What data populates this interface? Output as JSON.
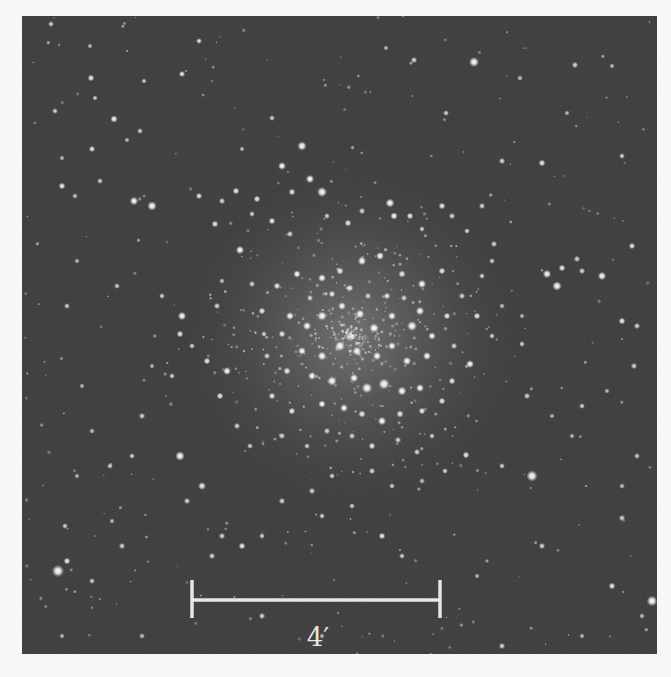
{
  "image": {
    "subject": "globular star cluster",
    "colors": {
      "page_background": "#f7f7f7",
      "sky_background": "#3b3b3b",
      "star": "#ffffff",
      "scale_bar": "#e6e6e6"
    }
  },
  "scale_bar": {
    "label": "4′",
    "x1": 170,
    "x2": 418,
    "y": 584,
    "tick_top": 564,
    "tick_bottom": 602,
    "label_x": 296,
    "label_y": 630
  },
  "cluster_core": {
    "cx": 330,
    "cy": 320,
    "r1": 70,
    "r2": 150,
    "r3": 230
  },
  "stars": [
    [
      177,
      25,
      2.2,
      0.9
    ],
    [
      160,
      58,
      2.4,
      0.9
    ],
    [
      122,
      65,
      2.0,
      0.8
    ],
    [
      73,
      82,
      2.0,
      0.8
    ],
    [
      92,
      103,
      2.8,
      0.95
    ],
    [
      118,
      115,
      2.2,
      0.8
    ],
    [
      70,
      133,
      2.4,
      0.9
    ],
    [
      40,
      170,
      2.6,
      0.9
    ],
    [
      250,
      102,
      2.2,
      0.8
    ],
    [
      280,
      130,
      3.5,
      1
    ],
    [
      260,
      150,
      3.0,
      1
    ],
    [
      288,
      163,
      3.2,
      1
    ],
    [
      300,
      176,
      3.8,
      1
    ],
    [
      270,
      176,
      2.6,
      0.9
    ],
    [
      235,
      183,
      2.6,
      0.9
    ],
    [
      214,
      175,
      2.6,
      0.9
    ],
    [
      177,
      180,
      2.4,
      0.9
    ],
    [
      193,
      208,
      2.6,
      0.9
    ],
    [
      230,
      198,
      2.2,
      0.8
    ],
    [
      29,
      8,
      2.2,
      0.8
    ],
    [
      68,
      30,
      2.0,
      0.7
    ],
    [
      69,
      62,
      2.6,
      0.9
    ],
    [
      392,
      44,
      2.4,
      0.8
    ],
    [
      424,
      97,
      2.2,
      0.8
    ],
    [
      452,
      46,
      3.8,
      1
    ],
    [
      498,
      62,
      2.2,
      0.7
    ],
    [
      553,
      49,
      2.4,
      0.8
    ],
    [
      545,
      97,
      2.0,
      0.7
    ],
    [
      33,
      95,
      2.2,
      0.8
    ],
    [
      40,
      142,
      2.0,
      0.7
    ],
    [
      105,
      124,
      2.0,
      0.7
    ],
    [
      78,
      165,
      2.2,
      0.8
    ],
    [
      53,
      180,
      2.2,
      0.7
    ],
    [
      112,
      185,
      3.2,
      1
    ],
    [
      130,
      190,
      3.6,
      1
    ],
    [
      200,
      185,
      2.4,
      0.8
    ],
    [
      364,
      32,
      2.0,
      0.7
    ],
    [
      480,
      145,
      2.4,
      0.8
    ],
    [
      520,
      147,
      2.6,
      0.9
    ],
    [
      472,
      228,
      2.4,
      0.8
    ],
    [
      220,
      133,
      2.0,
      0.7
    ],
    [
      590,
      50,
      2.0,
      0.7
    ],
    [
      600,
      140,
      2.2,
      0.8
    ],
    [
      610,
      230,
      2.4,
      0.9
    ],
    [
      535,
      270,
      3.6,
      1
    ],
    [
      525,
      258,
      3.2,
      1
    ],
    [
      540,
      252,
      2.6,
      0.9
    ],
    [
      560,
      255,
      2.4,
      0.8
    ],
    [
      555,
      243,
      2.4,
      0.8
    ],
    [
      580,
      260,
      3.2,
      1
    ],
    [
      600,
      305,
      2.6,
      0.9
    ],
    [
      615,
      310,
      2.4,
      0.8
    ],
    [
      612,
      350,
      2.4,
      0.8
    ],
    [
      585,
      375,
      2.0,
      0.7
    ],
    [
      560,
      390,
      2.2,
      0.8
    ],
    [
      530,
      400,
      2.0,
      0.7
    ],
    [
      505,
      380,
      2.4,
      0.8
    ],
    [
      500,
      328,
      2.2,
      0.8
    ],
    [
      615,
      440,
      2.2,
      0.8
    ],
    [
      600,
      470,
      2.2,
      0.7
    ],
    [
      550,
      420,
      2.0,
      0.7
    ],
    [
      510,
      460,
      4.2,
      1
    ],
    [
      480,
      450,
      2.2,
      0.8
    ],
    [
      444,
      439,
      2.6,
      0.9
    ],
    [
      423,
      455,
      2.2,
      0.8
    ],
    [
      600,
      502,
      2.4,
      0.8
    ],
    [
      630,
      585,
      4.0,
      1
    ],
    [
      590,
      570,
      2.6,
      0.9
    ],
    [
      520,
      530,
      2.4,
      0.8
    ],
    [
      455,
      560,
      2.0,
      0.7
    ],
    [
      480,
      630,
      2.4,
      0.8
    ],
    [
      560,
      620,
      2.0,
      0.7
    ],
    [
      620,
      600,
      2.2,
      0.7
    ],
    [
      36,
      555,
      4.6,
      1
    ],
    [
      45,
      545,
      2.6,
      0.9
    ],
    [
      70,
      565,
      2.2,
      0.8
    ],
    [
      43,
      510,
      2.2,
      0.8
    ],
    [
      100,
      530,
      2.4,
      0.8
    ],
    [
      90,
      505,
      2.0,
      0.7
    ],
    [
      55,
      460,
      2.0,
      0.7
    ],
    [
      70,
      415,
      2.2,
      0.7
    ],
    [
      88,
      450,
      2.2,
      0.8
    ],
    [
      60,
      370,
      2.0,
      0.7
    ],
    [
      120,
      400,
      2.4,
      0.8
    ],
    [
      110,
      440,
      2.2,
      0.8
    ],
    [
      158,
      440,
      3.6,
      1
    ],
    [
      180,
      470,
      3.0,
      0.9
    ],
    [
      165,
      485,
      2.4,
      0.8
    ],
    [
      190,
      540,
      2.4,
      0.8
    ],
    [
      200,
      520,
      2.4,
      0.8
    ],
    [
      220,
      530,
      2.6,
      0.9
    ],
    [
      240,
      520,
      2.2,
      0.8
    ],
    [
      260,
      485,
      2.4,
      0.8
    ],
    [
      300,
      500,
      2.2,
      0.8
    ],
    [
      330,
      490,
      2.2,
      0.8
    ],
    [
      360,
      520,
      2.6,
      0.9
    ],
    [
      380,
      540,
      2.2,
      0.8
    ],
    [
      240,
      600,
      2.4,
      0.8
    ],
    [
      300,
      620,
      2.0,
      0.7
    ],
    [
      40,
      620,
      2.0,
      0.7
    ],
    [
      120,
      620,
      2.2,
      0.7
    ],
    [
      45,
      290,
      2.2,
      0.8
    ],
    [
      55,
      245,
      2.0,
      0.7
    ],
    [
      95,
      270,
      2.2,
      0.8
    ],
    [
      140,
      280,
      2.2,
      0.8
    ],
    [
      160,
      300,
      3.2,
      1
    ],
    [
      158,
      318,
      2.6,
      0.9
    ],
    [
      170,
      330,
      2.2,
      0.8
    ],
    [
      185,
      345,
      2.6,
      0.9
    ],
    [
      205,
      355,
      3.0,
      1
    ],
    [
      198,
      380,
      2.6,
      0.9
    ],
    [
      150,
      360,
      2.2,
      0.8
    ],
    [
      130,
      350,
      2.0,
      0.7
    ],
    [
      218,
      234,
      3.2,
      1
    ],
    [
      230,
      268,
      2.4,
      0.8
    ],
    [
      240,
      295,
      2.6,
      0.9
    ],
    [
      250,
      205,
      2.6,
      0.9
    ],
    [
      268,
      218,
      2.4,
      0.8
    ],
    [
      305,
      200,
      2.2,
      0.8
    ],
    [
      326,
      207,
      2.6,
      0.9
    ],
    [
      340,
      195,
      2.4,
      0.8
    ],
    [
      368,
      187,
      3.4,
      1
    ],
    [
      372,
      200,
      2.8,
      1
    ],
    [
      388,
      200,
      2.6,
      0.9
    ],
    [
      400,
      213,
      2.2,
      0.8
    ],
    [
      420,
      190,
      2.6,
      0.9
    ],
    [
      430,
      200,
      2.4,
      0.8
    ],
    [
      445,
      215,
      2.2,
      0.8
    ],
    [
      460,
      190,
      2.4,
      0.8
    ],
    [
      470,
      245,
      2.2,
      0.8
    ],
    [
      340,
      245,
      3.2,
      1
    ],
    [
      358,
      240,
      3.0,
      1
    ],
    [
      380,
      258,
      2.8,
      0.9
    ],
    [
      400,
      268,
      3.2,
      1
    ],
    [
      420,
      255,
      2.6,
      0.9
    ],
    [
      440,
      280,
      2.4,
      0.8
    ],
    [
      455,
      300,
      2.6,
      0.9
    ],
    [
      470,
      320,
      2.2,
      0.8
    ],
    [
      448,
      348,
      3.0,
      1
    ],
    [
      430,
      365,
      2.6,
      0.9
    ],
    [
      255,
      270,
      2.6,
      0.9
    ],
    [
      275,
      258,
      2.8,
      1
    ],
    [
      300,
      262,
      3.0,
      1
    ],
    [
      318,
      255,
      2.8,
      0.9
    ],
    [
      268,
      300,
      3.0,
      1
    ],
    [
      285,
      310,
      3.2,
      1
    ],
    [
      300,
      300,
      3.6,
      1
    ],
    [
      320,
      290,
      3.0,
      1
    ],
    [
      338,
      298,
      3.4,
      1
    ],
    [
      352,
      312,
      3.6,
      1
    ],
    [
      370,
      300,
      3.0,
      1
    ],
    [
      390,
      310,
      3.8,
      1
    ],
    [
      398,
      295,
      3.2,
      1
    ],
    [
      410,
      320,
      2.8,
      1
    ],
    [
      280,
      335,
      3.0,
      1
    ],
    [
      300,
      340,
      3.4,
      1
    ],
    [
      318,
      330,
      3.8,
      1
    ],
    [
      335,
      335,
      3.4,
      1
    ],
    [
      355,
      340,
      3.2,
      1
    ],
    [
      370,
      330,
      3.0,
      1
    ],
    [
      385,
      345,
      3.2,
      1
    ],
    [
      405,
      340,
      3.0,
      1
    ],
    [
      265,
      355,
      2.8,
      0.9
    ],
    [
      290,
      360,
      3.0,
      1
    ],
    [
      310,
      365,
      3.6,
      1
    ],
    [
      332,
      362,
      3.2,
      1
    ],
    [
      345,
      372,
      4.0,
      1
    ],
    [
      362,
      368,
      4.2,
      1
    ],
    [
      380,
      375,
      3.4,
      1
    ],
    [
      398,
      372,
      3.0,
      1
    ],
    [
      300,
      388,
      2.8,
      1
    ],
    [
      322,
      392,
      3.0,
      1
    ],
    [
      340,
      398,
      2.8,
      0.9
    ],
    [
      360,
      405,
      3.2,
      1
    ],
    [
      378,
      398,
      2.8,
      0.9
    ],
    [
      400,
      395,
      2.6,
      0.9
    ],
    [
      270,
      395,
      2.6,
      0.9
    ],
    [
      250,
      380,
      2.6,
      0.9
    ],
    [
      245,
      340,
      2.4,
      0.8
    ],
    [
      420,
      385,
      2.6,
      0.9
    ],
    [
      330,
      420,
      2.4,
      0.8
    ],
    [
      350,
      430,
      2.6,
      0.9
    ],
    [
      376,
      424,
      2.4,
      0.8
    ],
    [
      395,
      436,
      2.4,
      0.8
    ],
    [
      305,
      415,
      2.4,
      0.8
    ],
    [
      285,
      430,
      2.2,
      0.8
    ],
    [
      260,
      420,
      2.4,
      0.8
    ],
    [
      410,
      420,
      2.2,
      0.8
    ],
    [
      310,
      278,
      2.6,
      0.9
    ],
    [
      288,
      282,
      2.4,
      0.8
    ],
    [
      328,
      272,
      2.6,
      0.9
    ],
    [
      346,
      280,
      2.4,
      0.8
    ],
    [
      365,
      280,
      2.6,
      0.9
    ],
    [
      382,
      282,
      2.4,
      0.8
    ],
    [
      260,
      318,
      2.6,
      0.9
    ],
    [
      242,
      318,
      2.2,
      0.8
    ],
    [
      425,
      300,
      2.6,
      0.9
    ],
    [
      432,
      330,
      2.4,
      0.8
    ],
    [
      215,
      410,
      2.4,
      0.8
    ],
    [
      228,
      430,
      2.2,
      0.8
    ],
    [
      350,
      455,
      2.4,
      0.8
    ],
    [
      370,
      470,
      2.2,
      0.8
    ],
    [
      310,
      460,
      2.2,
      0.8
    ],
    [
      290,
      475,
      2.4,
      0.8
    ],
    [
      400,
      465,
      2.2,
      0.7
    ],
    [
      200,
      265,
      2.2,
      0.7
    ],
    [
      195,
      290,
      2.4,
      0.8
    ],
    [
      460,
      260,
      2.2,
      0.8
    ],
    [
      480,
      290,
      2.2,
      0.7
    ],
    [
      500,
      300,
      2.0,
      0.7
    ]
  ]
}
